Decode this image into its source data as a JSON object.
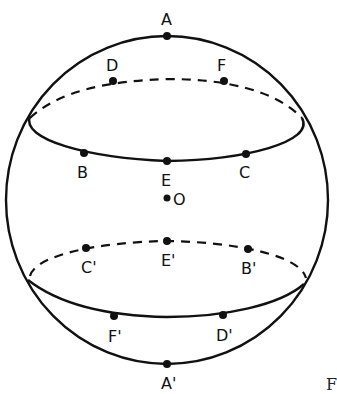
{
  "diagram": {
    "type": "sphere-with-parallel-circles",
    "stroke_color": "#111111",
    "background": "#ffffff",
    "points": {
      "A": "A",
      "D": "D",
      "F": "F",
      "B": "B",
      "E": "E",
      "C": "C",
      "O": "O",
      "C_prime": "C'",
      "E_prime": "E'",
      "B_prime": "B'",
      "F_prime": "F'",
      "D_prime": "D'",
      "A_prime": "A'"
    },
    "circles": [
      {
        "name": "upper-circle",
        "points_front": [
          "B",
          "E",
          "C"
        ],
        "points_back": [
          "D",
          "F"
        ]
      },
      {
        "name": "lower-circle",
        "points_front": [
          "F'",
          "D'"
        ],
        "points_back": [
          "C'",
          "E'",
          "B'"
        ]
      }
    ],
    "caption_fragment": "F"
  }
}
